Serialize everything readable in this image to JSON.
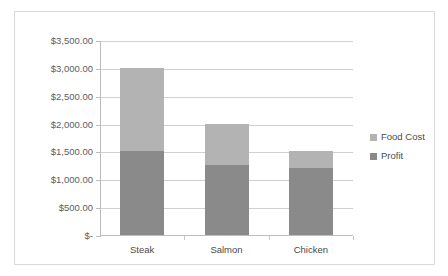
{
  "chart_data": {
    "type": "bar",
    "subtype": "stacked-bar",
    "title": "",
    "xlabel": "",
    "ylabel": "",
    "categories": [
      "Steak",
      "Salmon",
      "Chicken"
    ],
    "series": [
      {
        "name": "Profit",
        "values": [
          1500,
          1250,
          1200
        ],
        "color": "#8a8a8a"
      },
      {
        "name": "Food Cost",
        "values": [
          1500,
          750,
          300
        ],
        "color": "#b3b3b3"
      }
    ],
    "totals": [
      3000,
      2000,
      1500
    ],
    "ylim": [
      0,
      3500
    ],
    "ytick_step": 500,
    "ytick_labels": [
      "$3,500.00",
      "$3,000.00",
      "$2,500.00",
      "$2,000.00",
      "$1,500.00",
      "$1,000.00",
      "$500.00",
      "$-"
    ],
    "ytick_values": [
      3500,
      3000,
      2500,
      2000,
      1500,
      1000,
      500,
      0
    ],
    "grid": true,
    "legend_position": "right",
    "legend_entries": [
      {
        "label": "Food Cost",
        "color": "#b3b3b3"
      },
      {
        "label": "Profit",
        "color": "#8a8a8a"
      }
    ],
    "colors": {
      "food_cost": "#b3b3b3",
      "profit": "#8a8a8a",
      "gridline": "#d0d0d0",
      "axis": "#bdbdbd",
      "border": "#d9d9d9",
      "text": "#4a4a4a",
      "background": "#ffffff"
    }
  }
}
